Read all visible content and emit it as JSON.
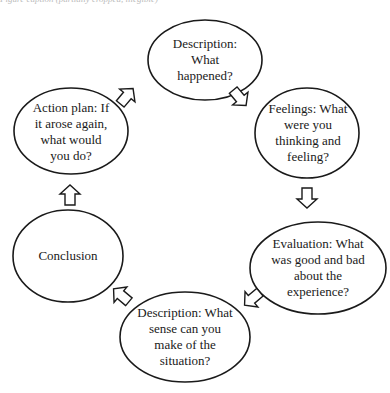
{
  "caption": "Figure caption (partially cropped, illegible)",
  "diagram": {
    "type": "cycle",
    "nodes": [
      {
        "id": "description",
        "label": "Description: What happened?",
        "lines": [
          "Description:",
          "What",
          "happened?"
        ]
      },
      {
        "id": "feelings",
        "label": "Feelings: What were you thinking and feeling?",
        "lines": [
          "Feelings: What",
          "were you",
          "thinking and",
          "feeling?"
        ]
      },
      {
        "id": "evaluation",
        "label": "Evaluation: What was good and bad about the experience?",
        "lines": [
          "Evaluation: What",
          "was good and bad",
          "about the",
          "experience?"
        ]
      },
      {
        "id": "analysis",
        "label": "Description: What sense can you make of the situation?",
        "lines": [
          "Description: What",
          "sense can you",
          "make of the",
          "situation?"
        ]
      },
      {
        "id": "conclusion",
        "label": "Conclusion",
        "lines": [
          "Conclusion"
        ]
      },
      {
        "id": "action_plan",
        "label": "Action plan: If it arose again, what would you do?",
        "lines": [
          "Action plan: If",
          "it arose again,",
          "what would",
          "you do?"
        ]
      }
    ],
    "edges": [
      {
        "from": "description",
        "to": "feelings"
      },
      {
        "from": "feelings",
        "to": "evaluation"
      },
      {
        "from": "evaluation",
        "to": "analysis"
      },
      {
        "from": "analysis",
        "to": "conclusion"
      },
      {
        "from": "conclusion",
        "to": "action_plan"
      },
      {
        "from": "action_plan",
        "to": "description"
      }
    ]
  },
  "colors": {
    "stroke": "#1a1a1a",
    "fill": "#ffffff",
    "text": "#1a1a1a"
  }
}
